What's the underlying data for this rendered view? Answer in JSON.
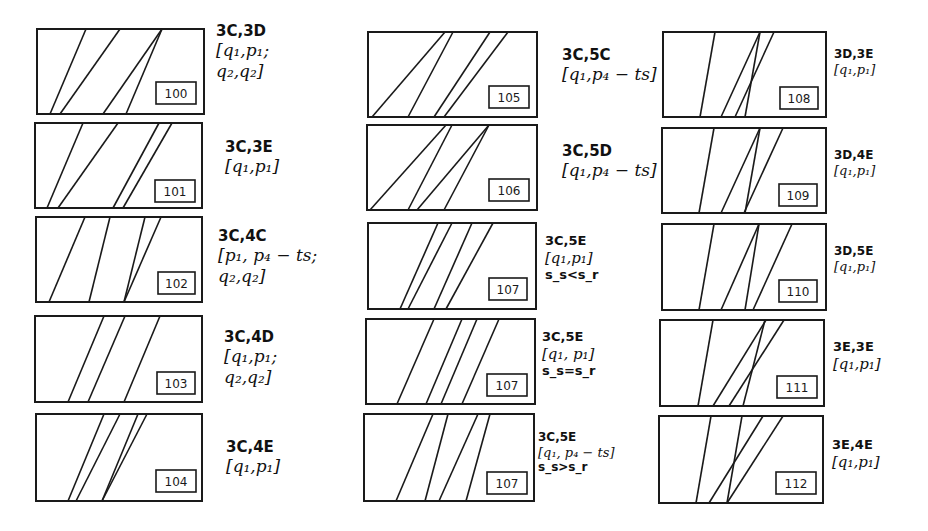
{
  "panels": [
    {
      "id": "100",
      "box": [
        37,
        29,
        204,
        114
      ],
      "tag_box": [
        156,
        82,
        40,
        22
      ],
      "lines": [
        [
          86,
          29,
          50,
          114
        ],
        [
          120,
          29,
          60,
          114
        ],
        [
          162,
          29,
          103,
          114
        ],
        [
          162,
          29,
          126,
          114
        ]
      ],
      "label": {
        "x": 216,
        "y": 22,
        "size": "lg",
        "code": "3C,3D",
        "math": [
          "[q₁,p₁;",
          "q₂,q₂]"
        ],
        "cond": ""
      }
    },
    {
      "id": "101",
      "box": [
        35,
        123,
        202,
        208
      ],
      "tag_box": [
        155,
        180,
        40,
        22
      ],
      "lines": [
        [
          83,
          123,
          47,
          208
        ],
        [
          118,
          123,
          58,
          208
        ],
        [
          159,
          123,
          113,
          208
        ],
        [
          172,
          123,
          123,
          208
        ]
      ],
      "label": {
        "x": 225,
        "y": 138,
        "size": "lg",
        "code": "3C,3E",
        "math": [
          "[q₁,p₁]"
        ],
        "cond": ""
      }
    },
    {
      "id": "102",
      "box": [
        36,
        217,
        202,
        302
      ],
      "tag_box": [
        158,
        272,
        37,
        22
      ],
      "lines": [
        [
          85,
          217,
          49,
          302
        ],
        [
          110,
          217,
          89,
          302
        ],
        [
          145,
          217,
          124,
          302
        ],
        [
          161,
          217,
          124,
          302
        ]
      ],
      "label": {
        "x": 218,
        "y": 227,
        "size": "lg",
        "code": "3C,4C",
        "math": [
          "[p₁, p₄ − ts;",
          "q₂,q₂]"
        ],
        "cond": ""
      }
    },
    {
      "id": "103",
      "box": [
        35,
        316,
        202,
        402
      ],
      "tag_box": [
        157,
        372,
        38,
        22
      ],
      "lines": [
        [
          104,
          316,
          68,
          402
        ],
        [
          125,
          316,
          88,
          402
        ],
        [
          160,
          316,
          124,
          402
        ]
      ],
      "label": {
        "x": 224,
        "y": 328,
        "size": "lg",
        "code": "3C,4D",
        "math": [
          "[q₁,p₁;",
          "q₂,q₂]"
        ],
        "cond": ""
      }
    },
    {
      "id": "104",
      "box": [
        36,
        414,
        202,
        501
      ],
      "tag_box": [
        156,
        470,
        40,
        22
      ],
      "lines": [
        [
          104,
          414,
          68,
          501
        ],
        [
          120,
          414,
          76,
          501
        ],
        [
          138,
          414,
          102,
          501
        ],
        [
          147,
          414,
          102,
          501
        ]
      ],
      "label": {
        "x": 226,
        "y": 438,
        "size": "lg",
        "code": "3C,4E",
        "math": [
          "[q₁,p₁]"
        ],
        "cond": ""
      }
    },
    {
      "id": "105",
      "box": [
        368,
        32,
        537,
        117
      ],
      "tag_box": [
        489,
        86,
        40,
        22
      ],
      "lines": [
        [
          445,
          32,
          372,
          117
        ],
        [
          453,
          32,
          408,
          117
        ],
        [
          490,
          32,
          434,
          117
        ],
        [
          508,
          32,
          444,
          117
        ]
      ],
      "label": {
        "x": 562,
        "y": 46,
        "size": "lg",
        "code": "3C,5C",
        "math": [
          "[q₁,p₄ − ts]"
        ],
        "cond": ""
      }
    },
    {
      "id": "106",
      "box": [
        367,
        125,
        537,
        210
      ],
      "tag_box": [
        489,
        179,
        40,
        22
      ],
      "lines": [
        [
          446,
          125,
          370,
          210
        ],
        [
          452,
          125,
          408,
          210
        ],
        [
          489,
          125,
          417,
          210
        ],
        [
          489,
          125,
          444,
          210
        ]
      ],
      "label": {
        "x": 562,
        "y": 142,
        "size": "lg",
        "code": "3C,5D",
        "math": [
          "[q₁,p₄ − ts]"
        ],
        "cond": ""
      }
    },
    {
      "id": "107",
      "box": [
        368,
        223,
        536,
        309
      ],
      "tag_box": [
        489,
        278,
        38,
        22
      ],
      "lines": [
        [
          438,
          223,
          400,
          309
        ],
        [
          452,
          223,
          408,
          309
        ],
        [
          472,
          223,
          434,
          309
        ],
        [
          493,
          223,
          446,
          309
        ]
      ],
      "label": {
        "x": 545,
        "y": 233,
        "size": "md",
        "code": "3C,5E",
        "math": [
          "[q₁,p₁]"
        ],
        "cond": "s_s<s_r"
      }
    },
    {
      "id": "107",
      "box": [
        366,
        319,
        535,
        404
      ],
      "tag_box": [
        487,
        374,
        40,
        22
      ],
      "lines": [
        [
          434,
          319,
          397,
          404
        ],
        [
          462,
          319,
          426,
          404
        ],
        [
          477,
          319,
          441,
          404
        ],
        [
          499,
          319,
          462,
          404
        ]
      ],
      "label": {
        "x": 542,
        "y": 329,
        "size": "md",
        "code": "3C,5E",
        "math": [
          "[q₁, p₁]"
        ],
        "cond": "s_s=s_r"
      }
    },
    {
      "id": "107",
      "box": [
        364,
        414,
        534,
        501
      ],
      "tag_box": [
        487,
        472,
        40,
        22
      ],
      "lines": [
        [
          433,
          414,
          396,
          501
        ],
        [
          448,
          414,
          425,
          501
        ],
        [
          478,
          414,
          439,
          501
        ],
        [
          490,
          414,
          466,
          501
        ]
      ],
      "label": {
        "x": 538,
        "y": 430,
        "size": "sm",
        "code": "3C,5E",
        "math": [
          "[q₁, p₄ − ts]"
        ],
        "cond": "s_s>s_r"
      }
    },
    {
      "id": "108",
      "box": [
        663,
        32,
        826,
        117
      ],
      "tag_box": [
        780,
        87,
        38,
        22
      ],
      "lines": [
        [
          715,
          32,
          700,
          117
        ],
        [
          760,
          32,
          721,
          117
        ],
        [
          760,
          32,
          745,
          117
        ],
        [
          774,
          32,
          735,
          117
        ]
      ],
      "label": {
        "x": 834,
        "y": 47,
        "size": "sm",
        "code": "3D,3E",
        "math": [
          "[q₁,p₁]"
        ],
        "cond": ""
      }
    },
    {
      "id": "109",
      "box": [
        662,
        128,
        826,
        213
      ],
      "tag_box": [
        779,
        184,
        38,
        22
      ],
      "lines": [
        [
          714,
          128,
          699,
          213
        ],
        [
          760,
          128,
          721,
          213
        ],
        [
          760,
          128,
          745,
          213
        ],
        [
          783,
          128,
          744,
          213
        ]
      ],
      "label": {
        "x": 834,
        "y": 148,
        "size": "sm",
        "code": "3D,4E",
        "math": [
          "[q₁,p₁]"
        ],
        "cond": ""
      }
    },
    {
      "id": "110",
      "box": [
        662,
        224,
        826,
        310
      ],
      "tag_box": [
        779,
        280,
        38,
        22
      ],
      "lines": [
        [
          714,
          224,
          699,
          310
        ],
        [
          759,
          224,
          721,
          310
        ],
        [
          759,
          224,
          745,
          310
        ],
        [
          792,
          224,
          753,
          310
        ]
      ],
      "label": {
        "x": 834,
        "y": 244,
        "size": "sm",
        "code": "3D,5E",
        "math": [
          "[q₁,p₁]"
        ],
        "cond": ""
      }
    },
    {
      "id": "111",
      "box": [
        660,
        320,
        824,
        406
      ],
      "tag_box": [
        777,
        376,
        40,
        22
      ],
      "lines": [
        [
          713,
          320,
          698,
          406
        ],
        [
          765,
          320,
          743,
          406
        ],
        [
          766,
          320,
          713,
          406
        ],
        [
          784,
          320,
          729,
          406
        ]
      ],
      "label": {
        "x": 833,
        "y": 339,
        "size": "md",
        "code": "3E,3E",
        "math": [
          "[q₁,p₁]"
        ],
        "cond": ""
      }
    },
    {
      "id": "112",
      "box": [
        659,
        416,
        823,
        503
      ],
      "tag_box": [
        776,
        472,
        40,
        22
      ],
      "lines": [
        [
          711,
          416,
          696,
          503
        ],
        [
          742,
          416,
          727,
          503
        ],
        [
          763,
          416,
          709,
          503
        ],
        [
          783,
          416,
          727,
          503
        ]
      ],
      "label": {
        "x": 832,
        "y": 437,
        "size": "md",
        "code": "3E,4E",
        "math": [
          "[q₁,p₁]"
        ],
        "cond": ""
      }
    }
  ],
  "style": {
    "stroke": "#1a1a1a",
    "background": "#ffffff"
  }
}
